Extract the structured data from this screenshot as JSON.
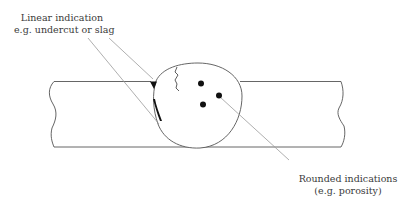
{
  "diagram": {
    "labels": {
      "linear": {
        "line1": "Linear indication",
        "line2": "e.g. undercut or slag"
      },
      "rounded": {
        "line1": "Rounded indications",
        "line2": "(e.g. porosity)"
      }
    },
    "colors": {
      "outline": "#555555",
      "leader": "#9a9a9a",
      "defect": "#111111",
      "text": "#3a3a3a",
      "background": "#ffffff"
    },
    "elements": {
      "plate": "Base metal plate with broken-off ends",
      "weld": "Weld bead cross-section (bulb)",
      "crack": "Linear crack indication",
      "undercut": "Undercut / slag at weld toe",
      "pores": "Three porosity dots"
    }
  }
}
